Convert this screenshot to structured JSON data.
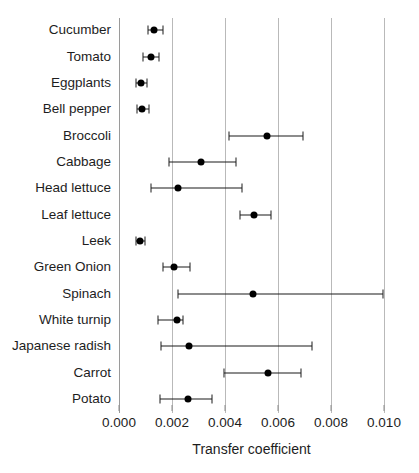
{
  "chart_data": {
    "type": "scatter",
    "title": "",
    "xlabel": "Transfer coefficient",
    "ylabel": "",
    "xlim": [
      0.0,
      0.01
    ],
    "ylim": null,
    "grid": "vertical",
    "legend": null,
    "orientation": "horizontal",
    "error_bars": "horizontal",
    "xticks": [
      0.0,
      0.002,
      0.004,
      0.006,
      0.008,
      0.01
    ],
    "xticklabels": [
      "0.000",
      "0.002",
      "0.004",
      "0.006",
      "0.008",
      "0.010"
    ],
    "categories": [
      "Cucumber",
      "Tomato",
      "Eggplants",
      "Bell pepper",
      "Broccoli",
      "Cabbage",
      "Head lettuce",
      "Leaf lettuce",
      "Leek",
      "Green Onion",
      "Spinach",
      "White turnip",
      "Japanese radish",
      "Carrot",
      "Potato"
    ],
    "points": [
      {
        "label": "Cucumber",
        "value": 0.00132,
        "low": 0.0011,
        "high": 0.00166
      },
      {
        "label": "Tomato",
        "value": 0.00121,
        "low": 0.00091,
        "high": 0.00151
      },
      {
        "label": "Eggplants",
        "value": 0.00083,
        "low": 0.00064,
        "high": 0.00106
      },
      {
        "label": "Bell pepper",
        "value": 0.00087,
        "low": 0.00068,
        "high": 0.00113
      },
      {
        "label": "Broccoli",
        "value": 0.00558,
        "low": 0.00415,
        "high": 0.00694
      },
      {
        "label": "Cabbage",
        "value": 0.0031,
        "low": 0.00189,
        "high": 0.00442
      },
      {
        "label": "Head lettuce",
        "value": 0.00223,
        "low": 0.0012,
        "high": 0.00464
      },
      {
        "label": "Leaf lettuce",
        "value": 0.00509,
        "low": 0.00457,
        "high": 0.00574
      },
      {
        "label": "Leek",
        "value": 0.00079,
        "low": 0.00064,
        "high": 0.00098
      },
      {
        "label": "Green Onion",
        "value": 0.00207,
        "low": 0.00166,
        "high": 0.00268
      },
      {
        "label": "Spinach",
        "value": 0.00506,
        "low": 0.00223,
        "high": 0.00996
      },
      {
        "label": "White turnip",
        "value": 0.00219,
        "low": 0.00147,
        "high": 0.00242
      },
      {
        "label": "Japanese radish",
        "value": 0.00263,
        "low": 0.00158,
        "high": 0.00729
      },
      {
        "label": "Carrot",
        "value": 0.00562,
        "low": 0.00396,
        "high": 0.00687
      },
      {
        "label": "Potato",
        "value": 0.0026,
        "low": 0.00156,
        "high": 0.00351
      }
    ],
    "colors": {
      "point": "#000000",
      "error_bar": "#1a1a1a",
      "gridline": "#b9b9b9",
      "text": "#1d1d1d",
      "background": "#ffffff"
    }
  },
  "caption_fragment": ""
}
